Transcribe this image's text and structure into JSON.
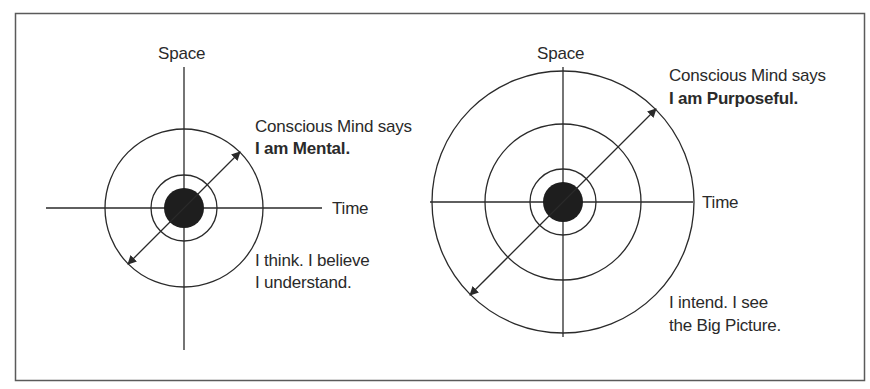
{
  "figure": {
    "border_color": "#5a5a5a",
    "line_color": "#2a2a2a",
    "dot_color": "#1e1e1e"
  },
  "left_diagram": {
    "axis_vertical_label": "Space",
    "axis_horizontal_label": "Time",
    "caption_line1": "Conscious Mind says",
    "caption_line2": "I am Mental.",
    "note_line1": "I think. I believe",
    "note_line2": "I understand.",
    "center": [
      184,
      208
    ],
    "rings": [
      20,
      33,
      79
    ]
  },
  "right_diagram": {
    "axis_vertical_label": "Space",
    "axis_horizontal_label": "Time",
    "caption_line1": "Conscious Mind says",
    "caption_line2": "I am Purposeful.",
    "note_line1": "I intend. I see",
    "note_line2": "the Big Picture.",
    "center": [
      563,
      202
    ],
    "rings": [
      20,
      33,
      78,
      131
    ]
  }
}
